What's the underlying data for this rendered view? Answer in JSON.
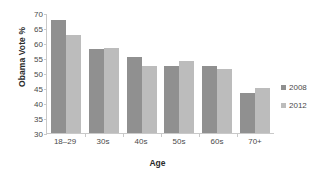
{
  "chart_data": {
    "type": "bar",
    "title": "",
    "xlabel": "Age",
    "ylabel": "Obama Vote %",
    "categories": [
      "18–29",
      "30s",
      "40s",
      "50s",
      "60s",
      "70+"
    ],
    "series": [
      {
        "name": "2008",
        "color": "#909090",
        "values": [
          67.8,
          58.0,
          55.2,
          52.5,
          52.5,
          43.5
        ]
      },
      {
        "name": "2012",
        "color": "#bcbcbc",
        "values": [
          62.7,
          58.3,
          52.5,
          54.0,
          51.3,
          45.0
        ]
      }
    ],
    "ylim": [
      30,
      70
    ],
    "ytick_values": [
      30,
      35,
      40,
      45,
      50,
      55,
      60,
      65,
      70
    ],
    "ytick_labels": [
      "30",
      "35",
      "40",
      "45",
      "50",
      "55",
      "60",
      "65",
      "70"
    ],
    "grid": false,
    "legend_position": "right"
  }
}
